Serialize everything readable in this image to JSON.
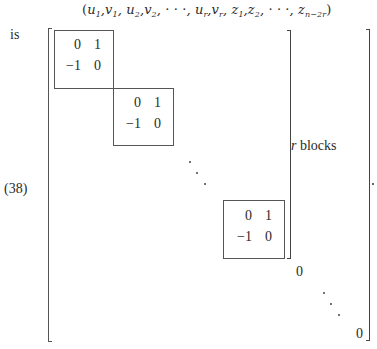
{
  "header": {
    "open": "(",
    "u1": "u",
    "u1_sub": "1",
    "v1": "v",
    "v1_sub": "1",
    "u2": "u",
    "u2_sub": "2",
    "v2": "v",
    "v2_sub": "2",
    "ellipsis1": "· · ·",
    "ur": "u",
    "ur_sub": "r",
    "vr": "v",
    "vr_sub": "r",
    "z1": "z",
    "z1_sub": "1",
    "z2": "z",
    "z2_sub": "2",
    "ellipsis2": "· · ·",
    "zn": "z",
    "zn_sub": "n−2r",
    "close": ")"
  },
  "prefix_text": "is",
  "equation_number": "(38)",
  "brace_label": {
    "var": "r",
    "text": " blocks"
  },
  "blocks": [
    {
      "a11": "0",
      "a12": "1",
      "a21": "−1",
      "a22": "0"
    },
    {
      "a11": "0",
      "a12": "1",
      "a21": "−1",
      "a22": "0"
    },
    {
      "a11": "0",
      "a12": "1",
      "a21": "−1",
      "a22": "0"
    }
  ],
  "zero_block_label": "0",
  "last_diag_entry": "0",
  "trailing_punct": "."
}
